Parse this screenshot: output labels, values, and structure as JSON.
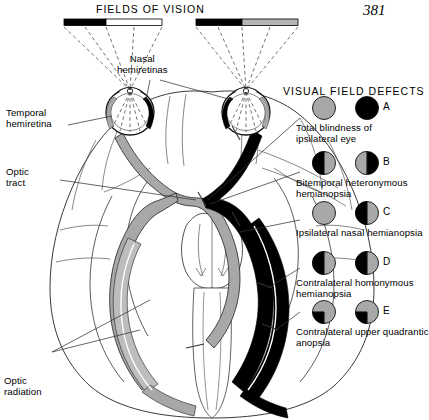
{
  "page": {
    "number": "381"
  },
  "headers": {
    "fields_of_vision": "FIELDS OF VISION",
    "visual_field_defects": "VISUAL FIELD DEFECTS"
  },
  "labels": {
    "nasal_hemiretinas": "Nasal\nhemiretinas",
    "temporal_hemiretina": "Temporal\nhemiretina",
    "optic_tract": "Optic\ntract",
    "optic_radiation": "Optic\nradiation"
  },
  "colors": {
    "black": "#000000",
    "grey": "#a8a8a8",
    "grey_light": "#bfbfbf",
    "white": "#ffffff",
    "outline": "#1a1a1a",
    "leader": "#333333"
  },
  "field_bars": [
    {
      "name": "left-field-bar",
      "left_half": "#000000",
      "right_half": "#ffffff"
    },
    {
      "name": "right-field-bar",
      "left_half": "#000000",
      "right_half": "#b5b5b5"
    }
  ],
  "defects": [
    {
      "letter": "A",
      "caption": "Total blindness of\nipsilateral eye",
      "left_eye": {
        "fill": "grey",
        "pattern": "full"
      },
      "right_eye": {
        "fill": "black",
        "pattern": "full"
      }
    },
    {
      "letter": "B",
      "caption": "Bitemporal heteronymous\nhemianopsia",
      "left_eye": {
        "pattern": "half",
        "left": "black",
        "right": "grey"
      },
      "right_eye": {
        "pattern": "half",
        "left": "grey",
        "right": "black"
      }
    },
    {
      "letter": "C",
      "caption": "Ipsilateral nasal hemianopsia",
      "left_eye": {
        "pattern": "full",
        "fill": "grey"
      },
      "right_eye": {
        "pattern": "half",
        "left": "black",
        "right": "grey"
      }
    },
    {
      "letter": "D",
      "caption": "Contralateral homonymous\nhemianopsia",
      "left_eye": {
        "pattern": "half",
        "left": "black",
        "right": "grey"
      },
      "right_eye": {
        "pattern": "half",
        "left": "black",
        "right": "grey"
      }
    },
    {
      "letter": "E",
      "caption": "Contralateral upper quadrantic\nanopsia",
      "left_eye": {
        "pattern": "quadrant",
        "base": "grey",
        "quad": "black",
        "quad_pos": "lower-left"
      },
      "right_eye": {
        "pattern": "quadrant",
        "base": "grey",
        "quad": "black",
        "quad_pos": "lower-left"
      }
    }
  ]
}
